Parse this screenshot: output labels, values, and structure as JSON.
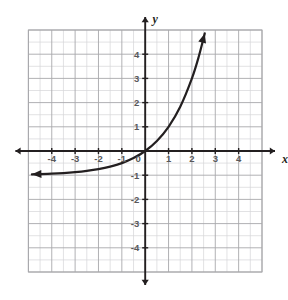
{
  "chart_data": {
    "type": "line",
    "title": "",
    "subtitle": "",
    "xlabel": "x",
    "ylabel": "y",
    "xlim": [
      -5,
      5
    ],
    "ylim": [
      -5,
      5
    ],
    "grid": true,
    "grid_major_step": 1,
    "grid_minor_step": 0.5,
    "legend": "none",
    "x_tick_labels": [
      "-4",
      "-3",
      "-2",
      "-1",
      "0",
      "1",
      "2",
      "3",
      "4"
    ],
    "x_tick_values": [
      -4,
      -3,
      -2,
      -1,
      0,
      1,
      2,
      3,
      4
    ],
    "y_tick_labels": [
      "4",
      "3",
      "2",
      "1",
      "-1",
      "-2",
      "-3",
      "-4"
    ],
    "y_tick_values": [
      4,
      3,
      2,
      1,
      -1,
      -2,
      -3,
      -4
    ],
    "origin_label": "0",
    "series": [
      {
        "name": "exponential-curve",
        "equation": "y = 2^x - 1",
        "color": "#231f20",
        "asymptote_y": -1,
        "arrow_start": true,
        "arrow_end": true,
        "points": [
          {
            "x": -4.85,
            "y": -0.965
          },
          {
            "x": -4.5,
            "y": -0.956
          },
          {
            "x": -4.0,
            "y": -0.938
          },
          {
            "x": -3.5,
            "y": -0.912
          },
          {
            "x": -3.0,
            "y": -0.875
          },
          {
            "x": -2.5,
            "y": -0.823
          },
          {
            "x": -2.0,
            "y": -0.75
          },
          {
            "x": -1.5,
            "y": -0.646
          },
          {
            "x": -1.0,
            "y": -0.5
          },
          {
            "x": -0.5,
            "y": -0.293
          },
          {
            "x": 0.0,
            "y": 0.0
          },
          {
            "x": 0.5,
            "y": 0.414
          },
          {
            "x": 1.0,
            "y": 1.0
          },
          {
            "x": 1.5,
            "y": 1.828
          },
          {
            "x": 2.0,
            "y": 3.0
          },
          {
            "x": 2.3,
            "y": 3.925
          },
          {
            "x": 2.55,
            "y": 4.86
          }
        ]
      }
    ],
    "reference_lines": [
      {
        "name": "x-axis",
        "orientation": "horizontal",
        "value": 0,
        "arrow_start": true,
        "arrow_end": true,
        "color": "#231f20"
      },
      {
        "name": "y-axis",
        "orientation": "vertical",
        "value": 0,
        "arrow_start": true,
        "arrow_end": true,
        "color": "#231f20"
      }
    ],
    "colors": {
      "background": "#ffffff",
      "grid_minor": "#d6d6d8",
      "grid_major": "#a8a8ab",
      "axis": "#231f20",
      "curve": "#231f20",
      "tick_text": "#58585a",
      "axis_text": "#231f20"
    }
  }
}
